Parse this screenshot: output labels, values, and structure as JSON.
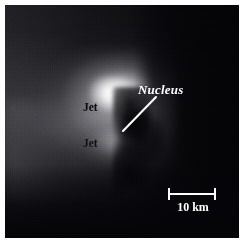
{
  "figure": {
    "kind": "comet-nucleus-image",
    "caption_labels": {
      "nucleus": "Nucleus",
      "jet_upper": "Jet",
      "jet_lower": "Jet"
    },
    "scale_bar": {
      "label": "10 km",
      "value": 10,
      "unit": "km",
      "length_px": 48
    },
    "colors": {
      "background": "#ffffff",
      "plate": "#07070a",
      "annotation": "#ffffff",
      "dark_annotation": "#0b0b0b"
    }
  }
}
